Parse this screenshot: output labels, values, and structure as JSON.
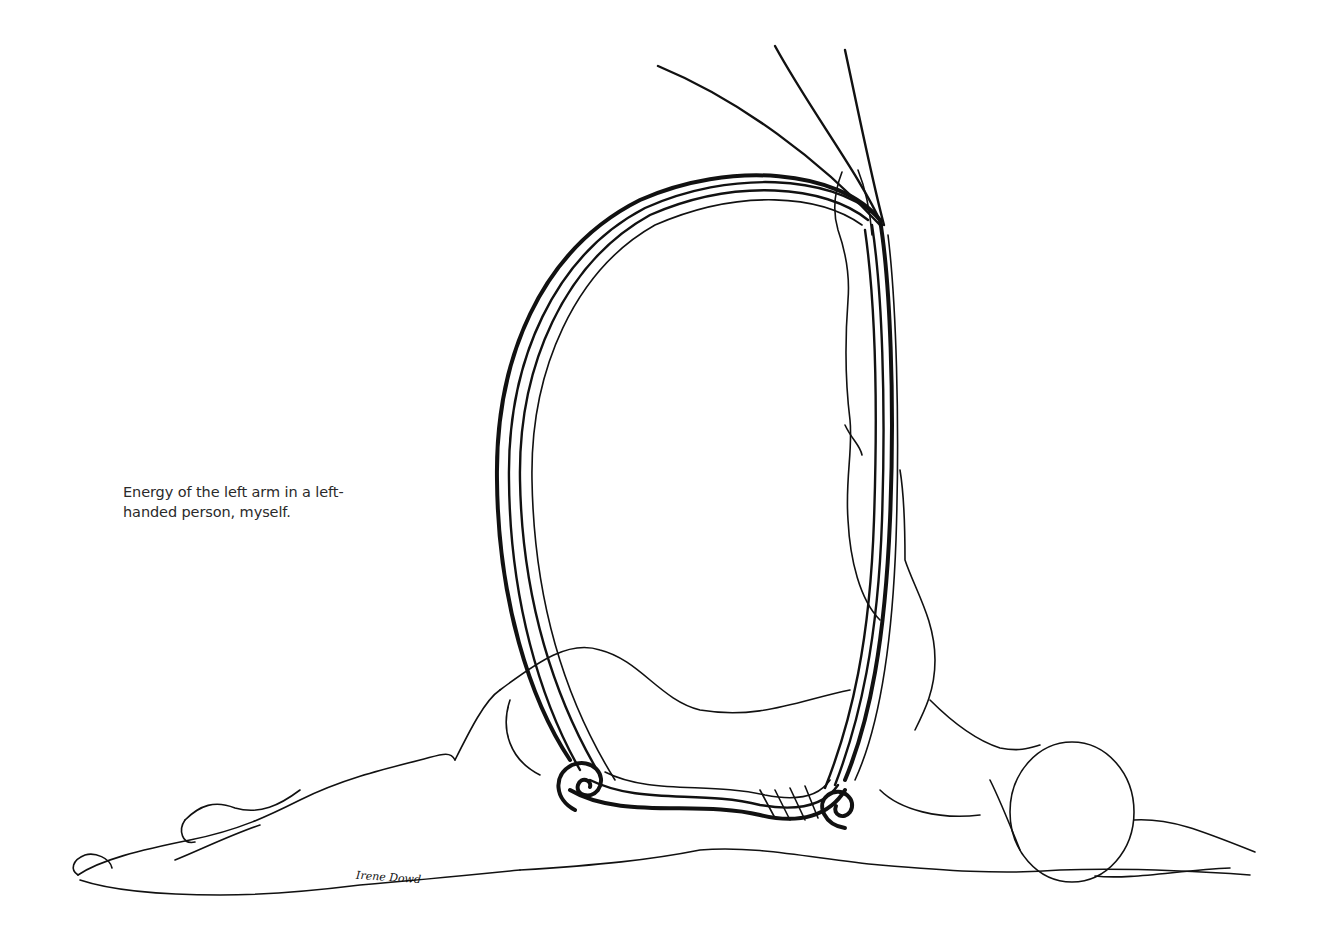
{
  "figure": {
    "caption": "Energy of the left arm in a left-handed person, myself.",
    "signature": "Irene Dowd",
    "colors": {
      "background": "#ffffff",
      "ink": "#111111",
      "caption_text": "#2a2a2a"
    }
  }
}
